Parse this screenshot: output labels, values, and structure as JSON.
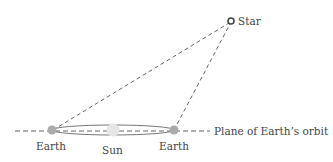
{
  "labels": {
    "star": "Star",
    "earth_left": "Earth",
    "sun": "Sun",
    "earth_right": "Earth",
    "plane": "Plane of Earth’s orbit"
  },
  "colors": {
    "line": "#555555",
    "earth": "#a9a9a9",
    "sun": "#e4e4e4",
    "text": "#444444"
  }
}
